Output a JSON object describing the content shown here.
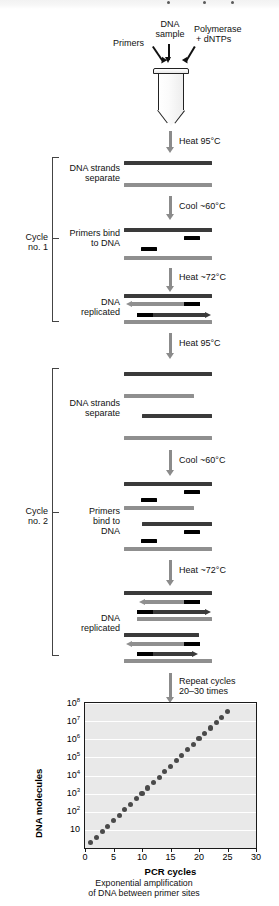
{
  "figure": {
    "title_ghost": "",
    "reagents": {
      "primers": "Primers",
      "dna_sample_line1": "DNA",
      "dna_sample_line2": "sample",
      "polymerase_line1": "Polymerase",
      "polymerase_line2": "+ dNTPs"
    },
    "steps": {
      "heat95_a": "Heat 95°C",
      "heat95_b": "Heat 95°C",
      "cool60_a": "Cool ~60°C",
      "cool60_b": "Cool ~60°C",
      "heat72_a": "Heat ~72°C",
      "heat72_b": "Heat ~72°C",
      "repeat_line1": "Repeat cycles",
      "repeat_line2": "20–30 times"
    },
    "cycle1": {
      "bracket_label_line1": "Cycle",
      "bracket_label_line2": "no. 1",
      "stage1_line1": "DNA strands",
      "stage1_line2": "separate",
      "stage2_line1": "Primers bind",
      "stage2_line2": "to DNA",
      "stage3_line1": "DNA",
      "stage3_line2": "replicated"
    },
    "cycle2": {
      "bracket_label_line1": "Cycle",
      "bracket_label_line2": "no. 2",
      "stage1_line1": "DNA strands",
      "stage1_line2": "separate",
      "stage2_line1": "Primers",
      "stage2_line2": "bind to",
      "stage2_line3": "DNA",
      "stage3_line1": "DNA",
      "stage3_line2": "replicated"
    },
    "colors": {
      "strand_dark": "#3a3a3a",
      "strand_light": "#8f8f8f",
      "primer": "#000000",
      "arrow_gray": "#8b8b8b",
      "plot_background": "#e9e9e9",
      "dot": "#4a4a4a",
      "gridline": "#ffffff",
      "axis": "#1a1a1a"
    }
  },
  "chart_data": {
    "type": "scatter",
    "title": "",
    "xlabel": "PCR cycles",
    "ylabel": "DNA molecules",
    "caption_line1": "Exponential amplification",
    "caption_line2": "of DNA between primer sites",
    "xlim": [
      0,
      30
    ],
    "ylim_log10": [
      0,
      8
    ],
    "xticks": [
      0,
      5,
      10,
      15,
      20,
      25,
      30
    ],
    "xtick_labels": [
      "0",
      "5",
      "10",
      "15",
      "20",
      "25",
      "30"
    ],
    "ytick_labels": [
      "10",
      "10²",
      "10³",
      "10⁴",
      "10⁵",
      "10⁶",
      "10⁷",
      "10⁸"
    ],
    "ytick_exponents": [
      1,
      2,
      3,
      4,
      5,
      6,
      7,
      8
    ],
    "grid": true,
    "legend": "none",
    "y_scale": "log",
    "x": [
      1,
      2,
      3,
      4,
      5,
      6,
      7,
      8,
      9,
      10,
      11,
      12,
      13,
      14,
      15,
      16,
      17,
      18,
      19,
      20,
      21,
      22,
      23,
      24,
      25
    ],
    "y": [
      2,
      4,
      8,
      16,
      32,
      64,
      128,
      256,
      512,
      1024,
      2048,
      4096,
      8192,
      16384,
      32768,
      65536,
      131072,
      262144,
      524288,
      1048576,
      2097152,
      4194304,
      8388608,
      16777216,
      33554432
    ],
    "note": "molecule count doubles each cycle (2^n)"
  }
}
